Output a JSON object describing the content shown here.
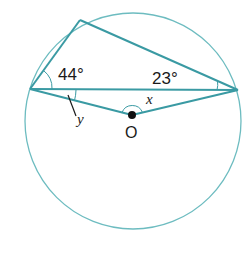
{
  "diagram": {
    "type": "circle-geometry",
    "circle": {
      "cx": 133,
      "cy": 121,
      "r": 108,
      "color": "#5fb3b8"
    },
    "line_color": "#3a9aa3",
    "points": {
      "top": {
        "x": 80,
        "y": 20
      },
      "left": {
        "x": 30,
        "y": 89
      },
      "right": {
        "x": 238,
        "y": 90
      },
      "center": {
        "x": 132,
        "y": 115
      }
    },
    "labels": {
      "angle_left": "44°",
      "angle_right": "23°",
      "angle_x": "x",
      "angle_y": "y",
      "center": "O"
    }
  }
}
